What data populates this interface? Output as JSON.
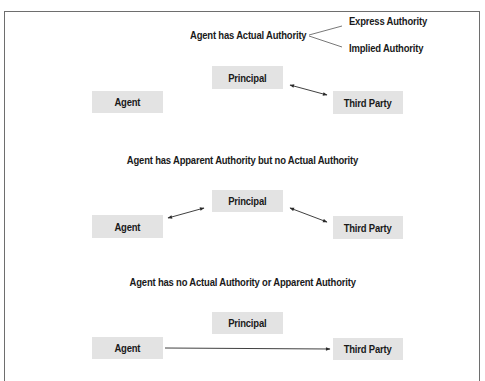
{
  "frame": {
    "border_color": "#6e6e6e",
    "box_fill": "#e3e3e3",
    "text_color": "#1a1a1a"
  },
  "section1": {
    "heading": "Agent has Actual Authority",
    "branches": [
      "Express Authority",
      "Implied Authority"
    ],
    "boxes": {
      "principal": "Principal",
      "agent": "Agent",
      "third_party": "Third Party"
    },
    "arrows": [
      {
        "from": "principal",
        "to": "third_party",
        "type": "bidirectional"
      }
    ]
  },
  "section2": {
    "heading": "Agent has Apparent Authority but no Actual Authority",
    "boxes": {
      "principal": "Principal",
      "agent": "Agent",
      "third_party": "Third Party"
    },
    "arrows": [
      {
        "from": "agent",
        "to": "principal",
        "type": "bidirectional"
      },
      {
        "from": "principal",
        "to": "third_party",
        "type": "bidirectional"
      }
    ]
  },
  "section3": {
    "heading": "Agent has no Actual Authority or Apparent Authority",
    "boxes": {
      "principal": "Principal",
      "agent": "Agent",
      "third_party": "Third Party"
    },
    "arrows": [
      {
        "from": "agent",
        "to": "third_party",
        "type": "unidirectional"
      }
    ]
  }
}
